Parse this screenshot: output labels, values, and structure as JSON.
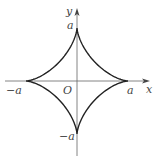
{
  "figure": {
    "type": "astroid",
    "equation_hint": "x^(2/3) + y^(2/3) = a^(2/3)",
    "axes": {
      "x_label": "x",
      "y_label": "y",
      "origin_label": "O"
    },
    "ticks": {
      "pos_x": "a",
      "neg_x": "−a",
      "pos_y": "a",
      "neg_y": "−a"
    },
    "colors": {
      "curve": "#222222",
      "axis": "#555555",
      "text": "#444444"
    },
    "geometry": {
      "cx": 77,
      "cy": 81,
      "rx": 51,
      "ry": 53
    }
  }
}
